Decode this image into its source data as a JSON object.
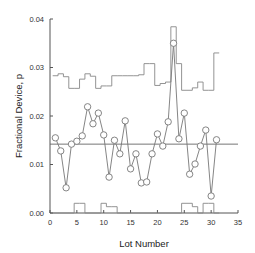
{
  "chart_data": {
    "type": "line",
    "title": "",
    "xlabel": "Lot Number",
    "ylabel": "Fractional Device, p",
    "xlim": [
      0,
      35
    ],
    "ylim": [
      0.0,
      0.04
    ],
    "xticks": [
      0,
      5,
      10,
      15,
      20,
      25,
      30,
      35
    ],
    "xtick_labels": [
      "0",
      "5",
      "10",
      "15",
      "20",
      "25",
      "30",
      "35"
    ],
    "yticks": [
      0.0,
      0.01,
      0.02,
      0.03,
      0.04
    ],
    "ytick_labels": [
      "0.00",
      "0.01",
      "0.02",
      "0.03",
      "0.04"
    ],
    "grid": false,
    "legend": null,
    "center_line": 0.0142,
    "series": [
      {
        "name": "p",
        "style": "line-markers-open-circle",
        "x": [
          1,
          2,
          3,
          4,
          5,
          6,
          7,
          8,
          9,
          10,
          11,
          12,
          13,
          14,
          15,
          16,
          17,
          18,
          19,
          20,
          21,
          22,
          23,
          24,
          25,
          26,
          27,
          28,
          29,
          30,
          31
        ],
        "values": [
          0.0155,
          0.0128,
          0.0052,
          0.0142,
          0.0148,
          0.0159,
          0.0219,
          0.0184,
          0.0206,
          0.0161,
          0.0074,
          0.015,
          0.0122,
          0.019,
          0.0091,
          0.0122,
          0.0062,
          0.0064,
          0.0122,
          0.0163,
          0.0138,
          0.0188,
          0.035,
          0.0153,
          0.0206,
          0.008,
          0.0101,
          0.0138,
          0.0171,
          0.0035,
          0.0151
        ]
      },
      {
        "name": "UCL",
        "style": "step",
        "x": [
          1,
          2,
          3,
          4,
          5,
          6,
          7,
          8,
          9,
          10,
          11,
          12,
          13,
          14,
          15,
          16,
          17,
          18,
          19,
          20,
          21,
          22,
          23,
          24,
          25,
          26,
          27,
          28,
          29,
          30,
          31
        ],
        "values": [
          0.0283,
          0.0287,
          0.0281,
          0.0257,
          0.0257,
          0.0276,
          0.0287,
          0.0282,
          0.0257,
          0.0262,
          0.0262,
          0.0283,
          0.0283,
          0.0283,
          0.0283,
          0.0283,
          0.0285,
          0.0308,
          0.0308,
          0.0263,
          0.0267,
          0.027,
          0.0384,
          0.0308,
          0.0253,
          0.0253,
          0.0258,
          0.027,
          0.0253,
          0.0253,
          0.033
        ]
      },
      {
        "name": "LCL",
        "style": "step",
        "x": [
          1,
          2,
          3,
          4,
          5,
          6,
          7,
          8,
          9,
          10,
          11,
          12,
          13,
          14,
          15,
          16,
          17,
          18,
          19,
          20,
          21,
          22,
          23,
          24,
          25,
          26,
          27,
          28,
          29,
          30,
          31
        ],
        "values": [
          0,
          0,
          0,
          0,
          0.002,
          0.002,
          0,
          0,
          0,
          0.002,
          0.0013,
          0.0013,
          0,
          0,
          0,
          0,
          0,
          0,
          0,
          0,
          0,
          0,
          0,
          0,
          0.002,
          0.002,
          0.0013,
          0,
          0.002,
          0.002,
          0
        ]
      }
    ]
  },
  "colors": {
    "axis": "#555555",
    "series": "#777777",
    "marker_fill": "#ffffff",
    "limits": "#888888",
    "center": "#666666"
  }
}
